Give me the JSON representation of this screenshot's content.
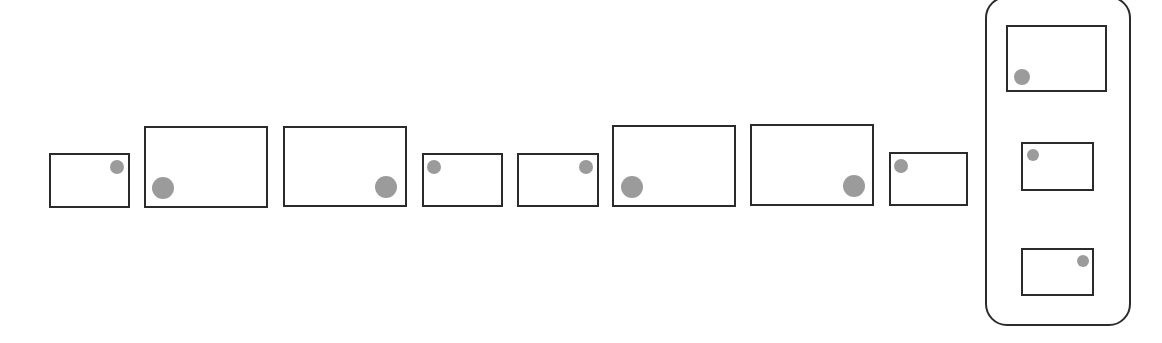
{
  "puzzle": {
    "type": "sequence-completion",
    "description": "Row of rectangles, each containing a gray dot at a corner; small and large rectangles alternate in pairs while the dot moves between corners. Answer options shown in rounded panel on the right.",
    "colors": {
      "frame_border": "#2b2b2b",
      "dot_fill": "#9b9b9b",
      "background": "#ffffff"
    },
    "sequence": [
      {
        "index": 1,
        "size": "small",
        "dot_corner": "top-right",
        "box": [
          49,
          153,
          81,
          55
        ],
        "dot": [
          117,
          167,
          7
        ]
      },
      {
        "index": 2,
        "size": "large",
        "dot_corner": "bottom-left",
        "box": [
          144,
          126,
          124,
          82
        ],
        "dot": [
          163,
          188,
          11
        ]
      },
      {
        "index": 3,
        "size": "large",
        "dot_corner": "bottom-right",
        "box": [
          283,
          126,
          124,
          81
        ],
        "dot": [
          386,
          187,
          11
        ]
      },
      {
        "index": 4,
        "size": "small",
        "dot_corner": "top-left",
        "box": [
          422,
          153,
          81,
          54
        ],
        "dot": [
          434,
          167,
          7
        ]
      },
      {
        "index": 5,
        "size": "small",
        "dot_corner": "top-right",
        "box": [
          517,
          153,
          82,
          54
        ],
        "dot": [
          586,
          167,
          7
        ]
      },
      {
        "index": 6,
        "size": "large",
        "dot_corner": "bottom-left",
        "box": [
          612,
          125,
          124,
          82
        ],
        "dot": [
          632,
          187,
          11
        ]
      },
      {
        "index": 7,
        "size": "large",
        "dot_corner": "bottom-right",
        "box": [
          750,
          124,
          124,
          82
        ],
        "dot": [
          854,
          186,
          11
        ]
      },
      {
        "index": 8,
        "size": "small",
        "dot_corner": "top-left",
        "box": [
          889,
          152,
          79,
          54
        ],
        "dot": [
          901,
          166,
          7
        ]
      }
    ],
    "options_panel": {
      "box": [
        985,
        -4,
        146,
        330
      ],
      "options": [
        {
          "index": 1,
          "size": "large",
          "dot_corner": "bottom-left",
          "box": [
            1006,
            25,
            101,
            67
          ],
          "dot": [
            1022,
            77,
            8
          ]
        },
        {
          "index": 2,
          "size": "small",
          "dot_corner": "top-left",
          "box": [
            1021,
            142,
            73,
            49
          ],
          "dot": [
            1033,
            155,
            6
          ]
        },
        {
          "index": 3,
          "size": "small",
          "dot_corner": "top-right",
          "box": [
            1021,
            248,
            73,
            48
          ],
          "dot": [
            1083,
            261,
            6
          ]
        }
      ]
    }
  }
}
